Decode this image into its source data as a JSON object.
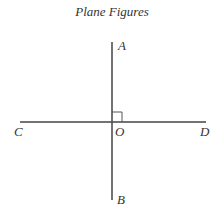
{
  "figure": {
    "title": "Plane Figures",
    "labels": {
      "A": "A",
      "B": "B",
      "C": "C",
      "D": "D",
      "O": "O"
    },
    "colors": {
      "line": "#444444",
      "text": "#333333"
    }
  }
}
